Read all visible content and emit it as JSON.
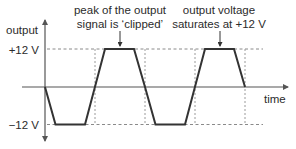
{
  "diagram": {
    "y_axis": {
      "label": "output",
      "ticks": [
        {
          "label": "+12 V",
          "value": 12
        },
        {
          "label": "−12 V",
          "value": -12
        }
      ]
    },
    "x_axis": {
      "label": "time"
    },
    "annotations": [
      {
        "id": "clipped",
        "lines": [
          "peak of the output",
          "signal is ‘clipped’"
        ]
      },
      {
        "id": "saturates",
        "lines": [
          "output voltage",
          "saturates at +12 V"
        ]
      }
    ],
    "waveform": {
      "description": "Trapezoidal (clipped) waveform alternating between -12 V and +12 V",
      "saturation_high": "+12 V",
      "saturation_low": "−12 V"
    },
    "colors": {
      "waveform": "#333333",
      "axes": "#555555",
      "guides": "#8a8a8a",
      "text": "#2b2b2b"
    }
  }
}
